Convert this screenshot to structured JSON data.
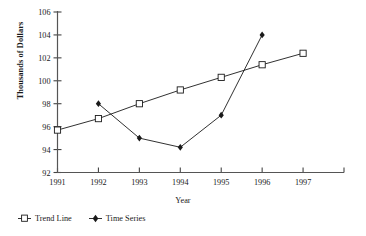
{
  "chart_data": {
    "type": "line",
    "title": "",
    "xlabel": "Year",
    "ylabel": "Thousands of Dollars",
    "categories": [
      "1991",
      "1992",
      "1993",
      "1994",
      "1995",
      "1996",
      "1997"
    ],
    "x": [
      1991,
      1992,
      1993,
      1994,
      1995,
      1996,
      1997
    ],
    "xlim": [
      1991,
      1998
    ],
    "ylim": [
      92,
      106
    ],
    "yticks": [
      92,
      94,
      96,
      98,
      100,
      102,
      104,
      106
    ],
    "ytick_labels": [
      "92",
      "94",
      "96",
      "98",
      "100",
      "102",
      "104",
      "106"
    ],
    "grid": false,
    "legend_position": "below-left",
    "series": [
      {
        "name": "Trend Line",
        "marker": "open-square",
        "color": "#1a1a1a",
        "x": [
          1991,
          1992,
          1993,
          1994,
          1995,
          1996,
          1997
        ],
        "values": [
          95.7,
          96.7,
          98.0,
          99.2,
          100.3,
          101.4,
          102.4
        ]
      },
      {
        "name": "Time Series",
        "marker": "filled-diamond",
        "color": "#1a1a1a",
        "x": [
          1992,
          1993,
          1994,
          1995,
          1996
        ],
        "values": [
          98.0,
          95.0,
          94.2,
          97.0,
          104.0
        ]
      }
    ]
  },
  "axes": {
    "y_title": "Thousands of Dollars",
    "x_title": "Year"
  },
  "legend": {
    "entries": [
      {
        "label": "Trend Line",
        "glyph": "open-square-with-line-icon"
      },
      {
        "label": "Time Series",
        "glyph": "filled-diamond-icon"
      }
    ]
  }
}
